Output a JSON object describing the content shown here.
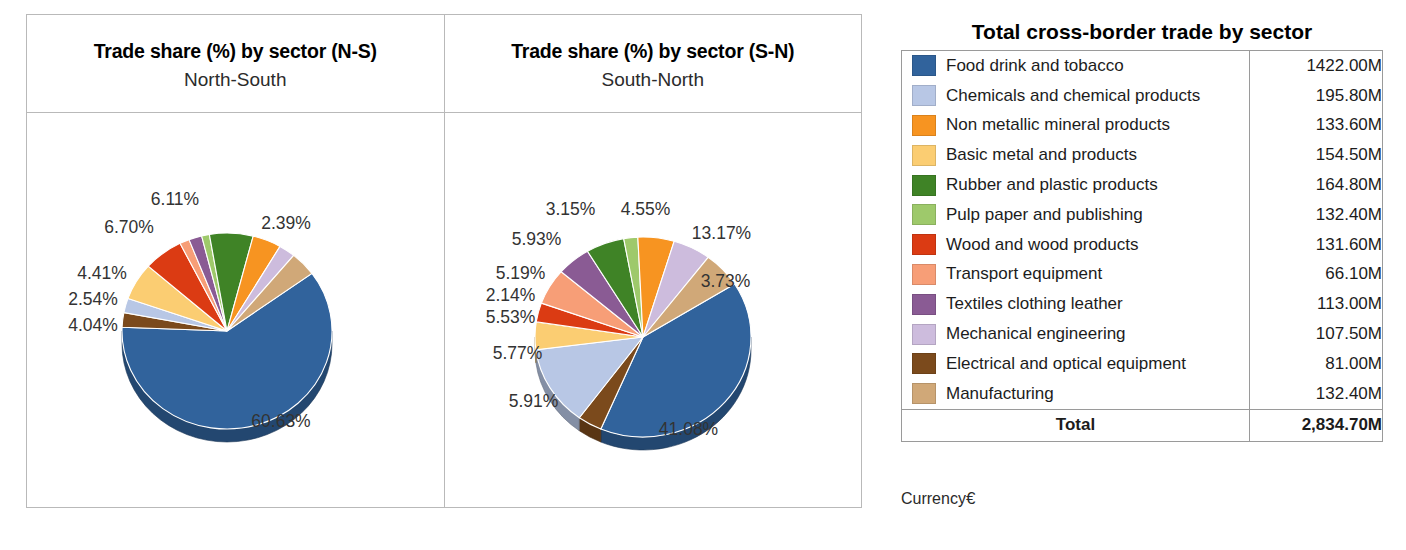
{
  "panels": [
    {
      "title": "Trade share (%) by sector (N-S)",
      "subtitle": "North-South"
    },
    {
      "title": "Trade share (%) by sector (S-N)",
      "subtitle": "South-North"
    }
  ],
  "table": {
    "title": "Total cross-border trade by sector",
    "total_label": "Total",
    "total_value": "2,834.70M",
    "rows": [
      {
        "label": "Food drink and tobacco",
        "value": "1422.00M",
        "color": "#31639c"
      },
      {
        "label": "Chemicals and chemical products",
        "value": "195.80M",
        "color": "#b8c7e5"
      },
      {
        "label": "Non metallic mineral products",
        "value": "133.60M",
        "color": "#f79421"
      },
      {
        "label": "Basic metal and products",
        "value": "154.50M",
        "color": "#fbcd72"
      },
      {
        "label": "Rubber and plastic products",
        "value": "164.80M",
        "color": "#3f8326"
      },
      {
        "label": "Pulp paper and publishing",
        "value": "132.40M",
        "color": "#9ec96b"
      },
      {
        "label": "Wood and wood products",
        "value": "131.60M",
        "color": "#db3b13"
      },
      {
        "label": "Transport equipment",
        "value": "66.10M",
        "color": "#f79e77"
      },
      {
        "label": "Textiles clothing leather",
        "value": "113.00M",
        "color": "#8a5b94"
      },
      {
        "label": "Mechanical engineering",
        "value": "107.50M",
        "color": "#cdbcdd"
      },
      {
        "label": "Electrical and optical equipment",
        "value": "81.00M",
        "color": "#7b4a1c"
      },
      {
        "label": "Manufacturing",
        "value": "132.40M",
        "color": "#d0a878"
      }
    ]
  },
  "currency_note": "Currency",
  "currency_symbol": "€",
  "chart_data": [
    {
      "type": "pie",
      "title": "Trade share (%) by sector (N-S)",
      "subtitle": "North-South",
      "legend_position": "external-right",
      "labels": [
        "Food drink and tobacco",
        "Electrical and optical equipment",
        "Chemicals and chemical products",
        "Basic metal and products",
        "Wood and wood products",
        "Transport equipment",
        "Textiles clothing leather",
        "Pulp paper and publishing",
        "Rubber and plastic products",
        "Non metallic mineral products",
        "Mechanical engineering",
        "Manufacturing"
      ],
      "values": [
        60.63,
        2.39,
        2.39,
        6.11,
        6.11,
        1.5,
        2.0,
        1.2,
        6.7,
        4.41,
        2.54,
        4.04
      ],
      "displayed_labels": [
        "60.63%",
        "2.39%",
        "6.11%",
        "6.70%",
        "4.41%",
        "2.54%",
        "4.04%"
      ],
      "slices": [
        {
          "label": "Food drink and tobacco",
          "value": 60.63,
          "display": "60.63%",
          "color": "#31639c"
        },
        {
          "label": "Electrical and optical equipment",
          "value": 2.39,
          "display": "2.39%",
          "color": "#7b4a1c"
        },
        {
          "label": "Chemicals and chemical products",
          "value": 2.39,
          "display": "",
          "color": "#b8c7e5"
        },
        {
          "label": "Basic metal and products",
          "value": 6.11,
          "display": "",
          "color": "#fbcd72"
        },
        {
          "label": "Wood and wood products",
          "value": 6.11,
          "display": "6.11%",
          "color": "#db3b13"
        },
        {
          "label": "Transport equipment",
          "value": 1.5,
          "display": "",
          "color": "#f79e77"
        },
        {
          "label": "Textiles clothing leather",
          "value": 2.0,
          "display": "",
          "color": "#8a5b94"
        },
        {
          "label": "Pulp paper and publishing",
          "value": 1.2,
          "display": "",
          "color": "#9ec96b"
        },
        {
          "label": "Rubber and plastic products",
          "value": 6.7,
          "display": "6.70%",
          "color": "#3f8326"
        },
        {
          "label": "Non metallic mineral products",
          "value": 4.41,
          "display": "4.41%",
          "color": "#f79421"
        },
        {
          "label": "Mechanical engineering",
          "value": 2.54,
          "display": "2.54%",
          "color": "#cdbcdd"
        },
        {
          "label": "Manufacturing",
          "value": 4.04,
          "display": "4.04%",
          "color": "#d0a878"
        }
      ]
    },
    {
      "type": "pie",
      "title": "Trade share (%) by sector (S-N)",
      "subtitle": "South-North",
      "legend_position": "external-right",
      "labels": [
        "Food drink and tobacco",
        "Electrical and optical equipment",
        "Chemicals and chemical products",
        "Basic metal and products",
        "Wood and wood products",
        "Transport equipment",
        "Textiles clothing leather",
        "Rubber and plastic products",
        "Pulp paper and publishing",
        "Non metallic mineral products",
        "Mechanical engineering",
        "Manufacturing"
      ],
      "values": [
        41.08,
        3.73,
        13.17,
        4.55,
        3.15,
        5.93,
        5.19,
        5.85,
        2.14,
        5.53,
        5.77,
        5.91
      ],
      "displayed_labels": [
        "41.08%",
        "3.73%",
        "13.17%",
        "4.55%",
        "3.15%",
        "5.93%",
        "5.19%",
        "2.14%",
        "5.53%",
        "5.77%",
        "5.91%"
      ],
      "slices": [
        {
          "label": "Food drink and tobacco",
          "value": 41.08,
          "display": "41.08%",
          "color": "#31639c"
        },
        {
          "label": "Electrical and optical equipment",
          "value": 3.73,
          "display": "3.73%",
          "color": "#7b4a1c"
        },
        {
          "label": "Chemicals and chemical products",
          "value": 13.17,
          "display": "13.17%",
          "color": "#b8c7e5"
        },
        {
          "label": "Basic metal and products",
          "value": 4.55,
          "display": "4.55%",
          "color": "#fbcd72"
        },
        {
          "label": "Wood and wood products",
          "value": 3.15,
          "display": "3.15%",
          "color": "#db3b13"
        },
        {
          "label": "Transport equipment",
          "value": 5.93,
          "display": "5.93%",
          "color": "#f79e77"
        },
        {
          "label": "Textiles clothing leather",
          "value": 5.19,
          "display": "5.19%",
          "color": "#8a5b94"
        },
        {
          "label": "Rubber and plastic products",
          "value": 5.85,
          "display": "",
          "color": "#3f8326"
        },
        {
          "label": "Pulp paper and publishing",
          "value": 2.14,
          "display": "2.14%",
          "color": "#9ec96b"
        },
        {
          "label": "Non metallic mineral products",
          "value": 5.53,
          "display": "5.53%",
          "color": "#f79421"
        },
        {
          "label": "Mechanical engineering",
          "value": 5.77,
          "display": "5.77%",
          "color": "#cdbcdd"
        },
        {
          "label": "Manufacturing",
          "value": 5.91,
          "display": "5.91%",
          "color": "#d0a878"
        }
      ]
    }
  ],
  "pie_label_positions": [
    [
      {
        "text": "2.39%",
        "x": 259,
        "y": 110
      },
      {
        "text": "6.11%",
        "x": 148,
        "y": 86
      },
      {
        "text": "6.70%",
        "x": 102,
        "y": 114
      },
      {
        "text": "4.41%",
        "x": 75,
        "y": 160
      },
      {
        "text": "2.54%",
        "x": 66,
        "y": 186
      },
      {
        "text": "4.04%",
        "x": 66,
        "y": 212
      },
      {
        "text": "60.63%",
        "x": 254,
        "y": 308
      }
    ],
    [
      {
        "text": "3.15%",
        "x": 126,
        "y": 96
      },
      {
        "text": "4.55%",
        "x": 201,
        "y": 96
      },
      {
        "text": "13.17%",
        "x": 277,
        "y": 120
      },
      {
        "text": "5.93%",
        "x": 92,
        "y": 126
      },
      {
        "text": "3.73%",
        "x": 281,
        "y": 168
      },
      {
        "text": "5.19%",
        "x": 76,
        "y": 160
      },
      {
        "text": "2.14%",
        "x": 66,
        "y": 182
      },
      {
        "text": "5.53%",
        "x": 66,
        "y": 204
      },
      {
        "text": "5.77%",
        "x": 73,
        "y": 240
      },
      {
        "text": "5.91%",
        "x": 89,
        "y": 288
      },
      {
        "text": "41.08%",
        "x": 244,
        "y": 316
      }
    ]
  ]
}
